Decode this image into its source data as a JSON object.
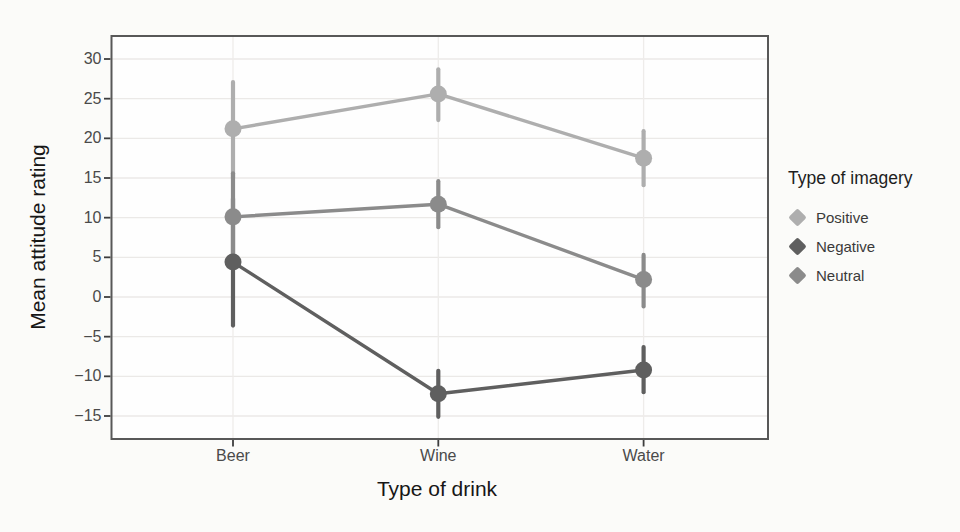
{
  "chart_data": {
    "type": "line",
    "subtype": "pointrange-with-error-bars",
    "title": "",
    "xlabel": "Type of drink",
    "ylabel": "Mean attitude rating",
    "categories": [
      "Beer",
      "Wine",
      "Water"
    ],
    "y_ticks": [
      30,
      25,
      20,
      15,
      10,
      5,
      0,
      -5,
      -10,
      -15
    ],
    "ylim": [
      -17.9,
      32.9
    ],
    "grid": true,
    "legend": {
      "title": "Type of imagery",
      "position": "right",
      "entries": [
        "Positive",
        "Negative",
        "Neutral"
      ]
    },
    "series": [
      {
        "name": "Positive",
        "color": "#aeaeae",
        "values": [
          21.2,
          25.6,
          17.5
        ],
        "error_low": [
          15.0,
          22.3,
          14.1
        ],
        "error_high": [
          27.1,
          28.7,
          20.9
        ]
      },
      {
        "name": "Negative",
        "color": "#5f5f5f",
        "values": [
          4.4,
          -12.2,
          -9.2
        ],
        "error_low": [
          -3.6,
          -15.1,
          -12.0
        ],
        "error_high": [
          12.4,
          -9.3,
          -6.3
        ]
      },
      {
        "name": "Neutral",
        "color": "#8b8b8b",
        "values": [
          10.1,
          11.7,
          2.2
        ],
        "error_low": [
          4.6,
          8.8,
          -1.2
        ],
        "error_high": [
          15.6,
          14.6,
          5.3
        ]
      }
    ]
  }
}
